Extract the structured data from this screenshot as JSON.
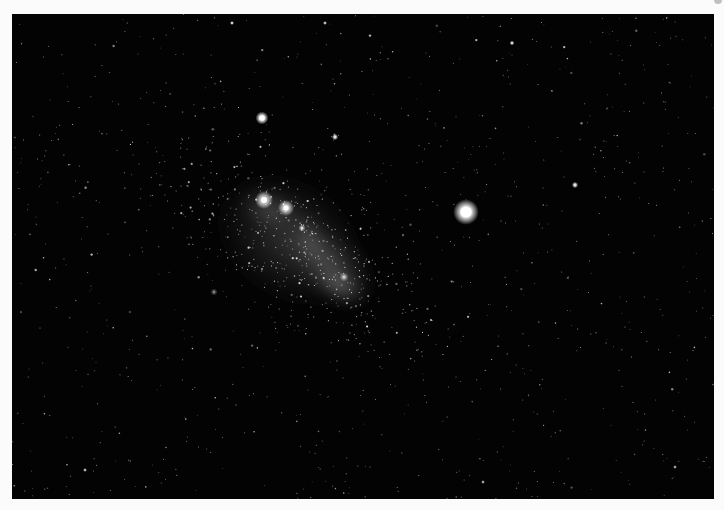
{
  "image": {
    "subject": "irregular dwarf galaxy in a dense starfield",
    "background_color": "#030303",
    "page_color": "#fbfbfb",
    "photo_frame": {
      "x": 12,
      "y": 14,
      "width": 702,
      "height": 485
    }
  },
  "galaxy": {
    "glow_regions": [
      {
        "cx": 290,
        "cy": 240,
        "rx": 95,
        "ry": 70,
        "rotate": 35,
        "opacity": 0.22
      },
      {
        "cx": 330,
        "cy": 265,
        "rx": 60,
        "ry": 38,
        "rotate": 40,
        "opacity": 0.28
      },
      {
        "cx": 270,
        "cy": 210,
        "rx": 40,
        "ry": 25,
        "rotate": 20,
        "opacity": 0.25
      },
      {
        "cx": 340,
        "cy": 285,
        "rx": 35,
        "ry": 20,
        "rotate": 30,
        "opacity": 0.35
      },
      {
        "cx": 310,
        "cy": 240,
        "rx": 20,
        "ry": 40,
        "rotate": -30,
        "opacity": 0.22
      }
    ],
    "knots": [
      {
        "x": 264,
        "y": 200,
        "r": 5,
        "brightness": 1.0
      },
      {
        "x": 286,
        "y": 208,
        "r": 4.5,
        "brightness": 0.95
      },
      {
        "x": 302,
        "y": 228,
        "r": 2,
        "brightness": 0.7
      },
      {
        "x": 344,
        "y": 277,
        "r": 2.5,
        "brightness": 0.6
      },
      {
        "x": 214,
        "y": 292,
        "r": 2,
        "brightness": 0.35
      }
    ]
  },
  "bright_stars": [
    {
      "x": 466,
      "y": 212,
      "r": 8,
      "brightness": 1.0
    },
    {
      "x": 262,
      "y": 118,
      "r": 4,
      "brightness": 0.95
    },
    {
      "x": 335,
      "y": 137,
      "r": 2,
      "brightness": 0.7
    },
    {
      "x": 575,
      "y": 185,
      "r": 2,
      "brightness": 0.7
    },
    {
      "x": 512,
      "y": 43,
      "r": 1.5,
      "brightness": 0.7
    },
    {
      "x": 325,
      "y": 23,
      "r": 1.3,
      "brightness": 0.6
    },
    {
      "x": 232,
      "y": 23,
      "r": 1.3,
      "brightness": 0.7
    },
    {
      "x": 85,
      "y": 470,
      "r": 1.3,
      "brightness": 0.55
    },
    {
      "x": 483,
      "y": 482,
      "r": 1.2,
      "brightness": 0.55
    },
    {
      "x": 675,
      "y": 467,
      "r": 1.2,
      "brightness": 0.55
    }
  ],
  "starfield": {
    "seed": 1729,
    "count": 900,
    "cluster_count": 500,
    "cluster_center": {
      "x": 300,
      "y": 245
    },
    "cluster_spread": {
      "x": 85,
      "y": 60
    }
  }
}
